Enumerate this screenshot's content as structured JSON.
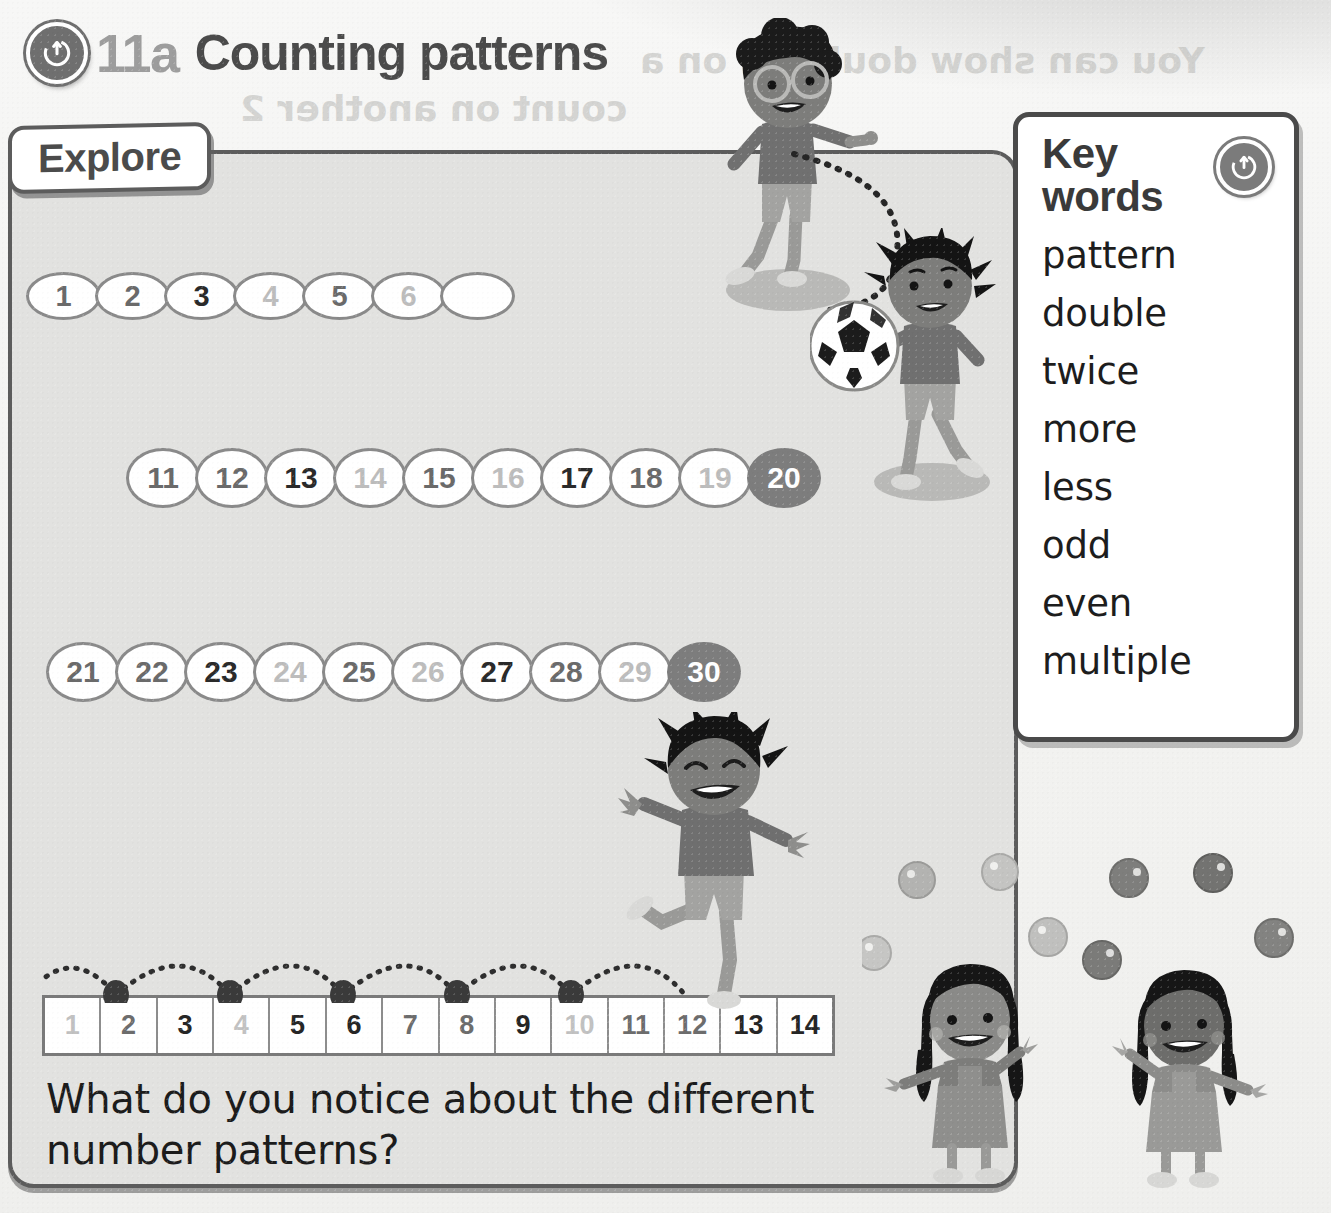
{
  "header": {
    "badge_icon": "power-up-icon",
    "chapter_number": "11a",
    "title": "Counting patterns"
  },
  "explore": {
    "tab_label": "Explore"
  },
  "keywords": {
    "title": "Key words",
    "badge_icon": "power-up-icon",
    "words": [
      "pattern",
      "double",
      "twice",
      "more",
      "less",
      "odd",
      "even",
      "multiple"
    ]
  },
  "number_rows": [
    {
      "name": "row-one-to-six",
      "shape": "oval",
      "cells": [
        {
          "value": "1",
          "tone": "mid"
        },
        {
          "value": "2",
          "tone": "mid"
        },
        {
          "value": "3",
          "tone": "dark"
        },
        {
          "value": "4",
          "tone": "light"
        },
        {
          "value": "5",
          "tone": "mid"
        },
        {
          "value": "6",
          "tone": "light"
        },
        {
          "value": "",
          "tone": "empty"
        }
      ]
    },
    {
      "name": "row-eleven-to-twenty",
      "shape": "circle",
      "cells": [
        {
          "value": "11",
          "tone": "mid"
        },
        {
          "value": "12",
          "tone": "mid"
        },
        {
          "value": "13",
          "tone": "dark"
        },
        {
          "value": "14",
          "tone": "light"
        },
        {
          "value": "15",
          "tone": "mid"
        },
        {
          "value": "16",
          "tone": "light"
        },
        {
          "value": "17",
          "tone": "dark"
        },
        {
          "value": "18",
          "tone": "mid"
        },
        {
          "value": "19",
          "tone": "light"
        },
        {
          "value": "20",
          "tone": "filled"
        }
      ]
    },
    {
      "name": "row-twentyone-to-thirty",
      "shape": "circle",
      "cells": [
        {
          "value": "21",
          "tone": "mid"
        },
        {
          "value": "22",
          "tone": "mid"
        },
        {
          "value": "23",
          "tone": "dark"
        },
        {
          "value": "24",
          "tone": "light"
        },
        {
          "value": "25",
          "tone": "mid"
        },
        {
          "value": "26",
          "tone": "light"
        },
        {
          "value": "27",
          "tone": "dark"
        },
        {
          "value": "28",
          "tone": "mid"
        },
        {
          "value": "29",
          "tone": "light"
        },
        {
          "value": "30",
          "tone": "filled"
        }
      ]
    }
  ],
  "number_line": {
    "cells": [
      {
        "value": "1",
        "tone": "light"
      },
      {
        "value": "2",
        "tone": "mid"
      },
      {
        "value": "3",
        "tone": "dark"
      },
      {
        "value": "4",
        "tone": "light"
      },
      {
        "value": "5",
        "tone": "dark"
      },
      {
        "value": "6",
        "tone": "dark"
      },
      {
        "value": "7",
        "tone": "mid"
      },
      {
        "value": "8",
        "tone": "mid"
      },
      {
        "value": "9",
        "tone": "dark"
      },
      {
        "value": "10",
        "tone": "light"
      },
      {
        "value": "11",
        "tone": "mid"
      },
      {
        "value": "12",
        "tone": "mid"
      },
      {
        "value": "13",
        "tone": "dark"
      },
      {
        "value": "14",
        "tone": "dark"
      }
    ],
    "hop_landings": [
      "2",
      "4",
      "6",
      "8",
      "10",
      "12"
    ]
  },
  "question": "What do you notice about the different number patterns?",
  "show_through_text": [
    {
      "text": "You can show doubling on a",
      "left": 640,
      "top": 40,
      "size": 36
    },
    {
      "text": "count on another 2",
      "left": 240,
      "top": 88,
      "size": 36
    },
    {
      "text": "numberline to show double these numbers",
      "left": 220,
      "top": 505,
      "size": 28
    },
    {
      "text": "Doubling",
      "left": 470,
      "top": 720,
      "size": 30
    },
    {
      "text": "Draw double the fingers to show",
      "left": 40,
      "top": 780,
      "size": 28
    }
  ],
  "colors": {
    "page_background": "#f3f3f1",
    "panel_background": "#e2e2e0",
    "panel_border": "#5c5c5c",
    "ink_dark": "#2a2a2a",
    "ink_mid": "#6a6a6a",
    "ink_light": "#bdbdbd",
    "filled_circle": "#7d7d7d",
    "title_gray": "#9d9d9d"
  },
  "illustrations": [
    {
      "name": "boy-with-glasses",
      "description": "boy with afro hair and glasses throwing"
    },
    {
      "name": "boy-with-football",
      "description": "boy with spiky hair holding a football"
    },
    {
      "name": "jumping-boy",
      "description": "boy jumping along the number line"
    },
    {
      "name": "girl-juggling-left",
      "description": "girl with pigtails juggling balls"
    },
    {
      "name": "girl-juggling-right",
      "description": "girl with long hair juggling balls"
    }
  ]
}
